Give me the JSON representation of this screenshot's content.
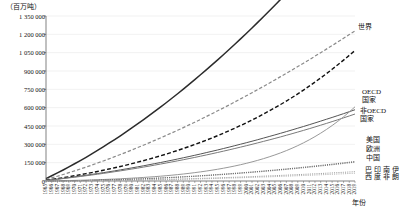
{
  "chart_data": {
    "type": "line",
    "title": "",
    "subtitle": "",
    "unit_label": "（百万吨）",
    "xlabel": "年份",
    "ylabel": "",
    "ylim": [
      0,
      1350000
    ],
    "ytick_labels": [
      "1 350 000",
      "1 200 000",
      "1 050 000",
      "900 000",
      "750 000",
      "600 000",
      "450 000",
      "300 000",
      "150 000",
      "0"
    ],
    "ytick_values": [
      1350000,
      1200000,
      1050000,
      900000,
      750000,
      600000,
      450000,
      300000,
      150000,
      0
    ],
    "grid": true,
    "legend_position": "right-inline",
    "x": [
      1965,
      1966,
      1967,
      1968,
      1969,
      1970,
      1971,
      1972,
      1973,
      1974,
      1975,
      1976,
      1977,
      1978,
      1979,
      1980,
      1981,
      1982,
      1983,
      1984,
      1985,
      1986,
      1987,
      1988,
      1989,
      1990,
      1991,
      1992,
      1993,
      1994,
      1995,
      1996,
      1997,
      1998,
      1999,
      2000,
      2001,
      2002,
      2003,
      2004,
      2005,
      2006,
      2007,
      2008,
      2009,
      2010,
      2011,
      2012,
      2013,
      2014,
      2015,
      2016,
      2017,
      2018,
      2019
    ],
    "xtick_labels": [
      "1965",
      "1966",
      "1967",
      "1968",
      "1969",
      "1970",
      "1971",
      "1972",
      "1973",
      "1974",
      "1975",
      "1976",
      "1977",
      "1978",
      "1979",
      "1980",
      "1981",
      "1982",
      "1983",
      "1984",
      "1985",
      "1986",
      "1987",
      "1988",
      "1989",
      "1990",
      "1991",
      "1992",
      "1993",
      "1994",
      "1995",
      "1996",
      "1997",
      "1998",
      "1999",
      "2000",
      "2001",
      "2002",
      "2003",
      "2004",
      "2005",
      "2006",
      "2007",
      "2008",
      "2009",
      "2010",
      "2011",
      "2012",
      "2013",
      "2014",
      "2015",
      "2016",
      "2017",
      "2018",
      "2019"
    ],
    "series": [
      {
        "name": "世界",
        "label": "世界",
        "color": "#2b2b2b",
        "style": "solid",
        "width": 1.5,
        "values": [
          20000,
          43000,
          66000,
          90000,
          115000,
          141000,
          167000,
          194000,
          222000,
          250000,
          279000,
          309000,
          339000,
          370000,
          402000,
          434000,
          467000,
          500000,
          534000,
          569000,
          604000,
          640000,
          677000,
          714000,
          752000,
          790000,
          829000,
          869000,
          909000,
          950000,
          991000,
          1033000,
          1076000,
          1119000,
          1163000,
          1207000,
          1252000,
          1298000,
          1344000,
          1391000,
          1438000,
          1486000,
          1535000,
          1584000,
          1634000,
          1684000,
          1735000,
          1787000,
          1839000,
          1892000,
          1946000,
          2000000,
          2055000,
          2110000,
          2166000
        ]
      },
      {
        "name": "OECD国家",
        "label": "OECD\n国家",
        "color": "#8a8a8a",
        "style": "dashed",
        "width": 1.2,
        "values": [
          12000,
          25000,
          39000,
          53000,
          68000,
          83000,
          98000,
          114000,
          130000,
          147000,
          164000,
          181000,
          199000,
          217000,
          235000,
          254000,
          273000,
          292000,
          312000,
          332000,
          352000,
          373000,
          394000,
          415000,
          437000,
          459000,
          481000,
          504000,
          527000,
          550000,
          574000,
          598000,
          622000,
          647000,
          672000,
          697000,
          722000,
          748000,
          774000,
          800000,
          827000,
          854000,
          881000,
          908000,
          936000,
          964000,
          992000,
          1021000,
          1050000,
          1079000,
          1108000,
          1138000,
          1168000,
          1198000,
          1228000
        ]
      },
      {
        "name": "非OECD国家",
        "label": "非OECD\n国家",
        "color": "#111111",
        "style": "dashed",
        "width": 1.4,
        "values": [
          6000,
          13000,
          20000,
          27000,
          35000,
          43000,
          51000,
          60000,
          69000,
          78000,
          88000,
          98000,
          108000,
          119000,
          130000,
          142000,
          154000,
          166000,
          179000,
          192000,
          206000,
          220000,
          235000,
          250000,
          266000,
          282000,
          299000,
          316000,
          334000,
          352000,
          371000,
          391000,
          411000,
          432000,
          454000,
          476000,
          499000,
          523000,
          548000,
          573000,
          599000,
          626000,
          654000,
          683000,
          713000,
          744000,
          776000,
          809000,
          843000,
          878000,
          914000,
          951000,
          989000,
          1028000,
          1068000
        ]
      },
      {
        "name": "美国",
        "label": "美国",
        "color": "#555555",
        "style": "solid",
        "width": 1.0,
        "values": [
          5000,
          10500,
          16000,
          22000,
          28000,
          34000,
          40500,
          47000,
          54000,
          61000,
          68000,
          75500,
          83000,
          91000,
          99000,
          107000,
          115500,
          124000,
          133000,
          142000,
          151000,
          160500,
          170000,
          180000,
          190000,
          200000,
          210500,
          221000,
          232000,
          243000,
          254000,
          265500,
          277000,
          289000,
          301000,
          313000,
          325500,
          338000,
          351000,
          364000,
          377000,
          390500,
          404000,
          418000,
          432000,
          446000,
          460500,
          475000,
          490000,
          505000,
          520000,
          535500,
          551000,
          567000,
          583000
        ]
      },
      {
        "name": "欧洲",
        "label": "欧洲",
        "color": "#7a7a7a",
        "style": "solid",
        "width": 1.0,
        "values": [
          4500,
          9500,
          14500,
          20000,
          25500,
          31000,
          37000,
          43000,
          49000,
          55500,
          62000,
          69000,
          76000,
          83000,
          90500,
          98000,
          105500,
          113500,
          121500,
          130000,
          138500,
          147000,
          156000,
          165000,
          174000,
          183500,
          193000,
          203000,
          213000,
          223000,
          233500,
          244000,
          255000,
          266000,
          277000,
          288500,
          300000,
          312000,
          324000,
          336000,
          348500,
          361000,
          374000,
          387000,
          400500,
          414000,
          428000,
          442000,
          456500,
          471000,
          486000,
          501000,
          516500,
          532000,
          548000
        ]
      },
      {
        "name": "中国",
        "label": "中国",
        "color": "#999999",
        "style": "solid",
        "width": 1.0,
        "values": [
          500,
          1200,
          2000,
          2900,
          3900,
          5000,
          6200,
          7500,
          9000,
          10600,
          12300,
          14200,
          16200,
          18400,
          20800,
          23300,
          26000,
          29000,
          32200,
          35600,
          39300,
          43300,
          47600,
          52200,
          57200,
          62600,
          68400,
          74600,
          81300,
          88500,
          96200,
          104500,
          113400,
          123000,
          133300,
          144400,
          156300,
          169000,
          182700,
          197400,
          213200,
          230200,
          248500,
          268200,
          289400,
          312200,
          336700,
          363000,
          391200,
          421400,
          453700,
          488300,
          525300,
          564900,
          607200
        ]
      },
      {
        "name": "巴西",
        "label": "巴西",
        "color": "#4a4a4a",
        "style": "dotted",
        "width": 0.9,
        "values": [
          200,
          500,
          900,
          1400,
          2000,
          2700,
          3500,
          4400,
          5400,
          6500,
          7700,
          9000,
          10400,
          11900,
          13500,
          15200,
          17000,
          18900,
          20900,
          23000,
          25200,
          27500,
          29900,
          32400,
          35000,
          37700,
          40500,
          43400,
          46400,
          49500,
          52700,
          56000,
          59400,
          62900,
          66500,
          70200,
          74000,
          77900,
          81900,
          86000,
          90200,
          94500,
          98900,
          103400,
          108000,
          112700,
          117500,
          122400,
          127400,
          132500,
          137700,
          143000,
          148400,
          153900,
          159500
        ]
      },
      {
        "name": "印度",
        "label": "印度",
        "color": "#666666",
        "style": "dotted",
        "width": 0.9,
        "values": [
          150,
          400,
          700,
          1100,
          1600,
          2200,
          2900,
          3700,
          4600,
          5600,
          6700,
          7900,
          9200,
          10600,
          12100,
          13700,
          15400,
          17200,
          19100,
          21100,
          23200,
          25400,
          27700,
          30100,
          32600,
          35200,
          37900,
          40700,
          43600,
          46600,
          49700,
          52900,
          56200,
          59600,
          63100,
          66700,
          70400,
          74200,
          78100,
          82100,
          86200,
          90400,
          94700,
          99100,
          103600,
          108200,
          112900,
          117700,
          122600,
          127600,
          132700,
          137900,
          143200,
          148600,
          154100
        ]
      },
      {
        "name": "南非",
        "label": "南非",
        "color": "#8c8c8c",
        "style": "dotted",
        "width": 0.9,
        "values": [
          100,
          280,
          500,
          780,
          1100,
          1470,
          1880,
          2340,
          2850,
          3400,
          4000,
          4650,
          5340,
          6080,
          6870,
          7700,
          8580,
          9500,
          10470,
          11490,
          12550,
          13660,
          14820,
          16020,
          17270,
          18570,
          19910,
          21300,
          22740,
          24220,
          25750,
          27330,
          28950,
          30620,
          32340,
          34100,
          35910,
          37770,
          39670,
          41620,
          43620,
          45660,
          47750,
          49890,
          52070,
          54300,
          56580,
          58900,
          61270,
          63690,
          66150,
          68660,
          71220,
          73820,
          76470
        ]
      },
      {
        "name": "伊朗",
        "label": "伊朗",
        "color": "#a5a5a5",
        "style": "dotted",
        "width": 0.9,
        "values": [
          60,
          180,
          340,
          540,
          780,
          1060,
          1380,
          1740,
          2140,
          2580,
          3060,
          3580,
          4140,
          4740,
          5380,
          6060,
          6780,
          7540,
          8340,
          9180,
          10060,
          10980,
          11940,
          12940,
          13980,
          15060,
          16180,
          17340,
          18540,
          19780,
          21060,
          22380,
          23740,
          25140,
          26580,
          28060,
          29580,
          31140,
          32740,
          34380,
          36060,
          37780,
          39540,
          41340,
          43180,
          45060,
          46980,
          48940,
          50940,
          52980,
          55060,
          57180,
          59340,
          61540,
          63780
        ]
      }
    ],
    "series_labels": [
      {
        "key": "world",
        "text": "世界",
        "left": 358,
        "top": 23,
        "orientation": "horizontal"
      },
      {
        "key": "oecd",
        "text": "OECD",
        "left": 362,
        "top": 88,
        "orientation": "horizontal"
      },
      {
        "key": "oecd2",
        "text": "国家",
        "left": 362,
        "top": 96,
        "orientation": "horizontal"
      },
      {
        "key": "nonoecd",
        "text": "非OECD",
        "left": 360,
        "top": 107,
        "orientation": "horizontal"
      },
      {
        "key": "nonoecd2",
        "text": "国家",
        "left": 360,
        "top": 115,
        "orientation": "horizontal"
      },
      {
        "key": "usa",
        "text": "美国",
        "left": 366,
        "top": 136,
        "orientation": "horizontal"
      },
      {
        "key": "europe",
        "text": "欧洲",
        "left": 366,
        "top": 145,
        "orientation": "horizontal"
      },
      {
        "key": "china",
        "text": "中国",
        "left": 366,
        "top": 154,
        "orientation": "horizontal"
      },
      {
        "key": "brazil",
        "text": "巴西",
        "left": 364,
        "top": 166,
        "orientation": "vertical"
      },
      {
        "key": "india",
        "text": "印度",
        "left": 373,
        "top": 166,
        "orientation": "vertical"
      },
      {
        "key": "southafrica",
        "text": "南非",
        "left": 382,
        "top": 166,
        "orientation": "vertical"
      },
      {
        "key": "iran",
        "text": "伊朗",
        "left": 391,
        "top": 166,
        "orientation": "vertical"
      }
    ]
  }
}
